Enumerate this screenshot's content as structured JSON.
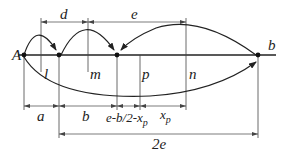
{
  "diagram": {
    "points": {
      "start_label": "A",
      "end_label": "b"
    },
    "vertical_labels": {
      "l": "l",
      "m": "m",
      "p": "p",
      "n": "n"
    },
    "top_dimensions": {
      "d": "d",
      "e": "e"
    },
    "bottom_dimensions": {
      "a": "a",
      "b": "b",
      "e_b2_xp_main": "e-b/2-x",
      "e_b2_xp_sub": "p",
      "xp_main": "x",
      "xp_sub": "p",
      "two_e": "2e"
    },
    "colors": {
      "line": "#222222",
      "dim_line": "#555555"
    }
  }
}
